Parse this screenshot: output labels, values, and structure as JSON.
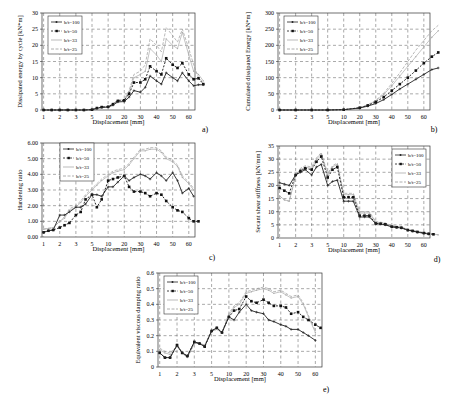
{
  "figure": {
    "panels": [
      "a)",
      "b)",
      "c)",
      "d)",
      "e)"
    ]
  },
  "legend": [
    "b/t=100",
    "b/t=50",
    "b/t=33",
    "b/t=25"
  ],
  "series_styles": [
    {
      "name": "b/t=100",
      "color": "#222222",
      "marker": "plus",
      "dash": ""
    },
    {
      "name": "b/t=50",
      "color": "#111111",
      "marker": "square",
      "dash": "2,1.5"
    },
    {
      "name": "b/t=33",
      "color": "#aaaaaa",
      "marker": "dot",
      "dash": ""
    },
    {
      "name": "b/t=25",
      "color": "#999999",
      "marker": "tick",
      "dash": "3,1.5"
    }
  ],
  "chart_data": [
    {
      "id": "a",
      "type": "line",
      "title": "",
      "panel_label": "a)",
      "xlabel": "Displacement [mm]",
      "ylabel": "Dissipated energy by cycle [kN*m]",
      "xticks": [
        "1",
        "2",
        "3",
        "5",
        "10",
        "20",
        "30",
        "40",
        "50",
        "60"
      ],
      "yticks": [
        "0",
        "5",
        "10",
        "15",
        "20",
        "25",
        "30"
      ],
      "ylim": [
        0,
        30
      ],
      "grid": true,
      "legend_position": "top-left",
      "x_index": [
        0,
        0.5,
        1,
        1.5,
        2,
        2.5,
        3,
        3.3,
        3.6,
        4,
        4.3,
        4.6,
        5,
        5.3,
        5.6,
        6,
        6.3,
        6.6,
        7,
        7.3,
        7.6,
        8,
        8.3,
        8.6,
        9,
        9.3,
        9.6,
        9.9
      ],
      "series": [
        {
          "name": "b/t=100",
          "values": [
            0,
            0,
            0,
            0,
            0,
            0,
            0.1,
            0.5,
            0.8,
            0.9,
            1.5,
            2.5,
            2.6,
            4,
            6,
            5.5,
            7,
            10.5,
            9,
            8,
            11.5,
            10,
            9,
            11.5,
            9,
            7.5,
            7.8,
            7.8
          ]
        },
        {
          "name": "b/t=50",
          "values": [
            0,
            0,
            0,
            0,
            0,
            0,
            0.1,
            0.6,
            0.9,
            1,
            1.8,
            2.8,
            3,
            5,
            8.5,
            8.5,
            9.5,
            13.5,
            12,
            11,
            16,
            14,
            13,
            14.5,
            11,
            9.5,
            9.8,
            8
          ]
        },
        {
          "name": "b/t=33",
          "values": [
            0,
            0,
            0,
            0,
            0,
            0,
            0.1,
            0.6,
            0.9,
            1,
            2,
            3,
            3.2,
            5.5,
            10,
            11,
            12,
            19,
            17,
            15,
            22,
            20,
            19,
            24,
            17,
            12,
            11,
            9
          ]
        },
        {
          "name": "b/t=25",
          "values": [
            0,
            0,
            0,
            0,
            0,
            0,
            0.1,
            0.6,
            0.9,
            1,
            2,
            3,
            3.3,
            6,
            11,
            12,
            14,
            22,
            20,
            18,
            25.5,
            23,
            21,
            25,
            19,
            14,
            10,
            8.5
          ]
        }
      ]
    },
    {
      "id": "b",
      "type": "line",
      "title": "",
      "panel_label": "b)",
      "xlabel": "Displacement [mm]",
      "ylabel": "Cumulated dissipated Energy [kN*m]",
      "xticks": [
        "1",
        "2",
        "3",
        "5",
        "10",
        "20",
        "30",
        "40",
        "50",
        "60"
      ],
      "yticks": [
        "0",
        "50",
        "100",
        "150",
        "200",
        "250",
        "300"
      ],
      "ylim": [
        0,
        300
      ],
      "grid": true,
      "legend_position": "top-left",
      "x_index": [
        0,
        1,
        2,
        3,
        4,
        5,
        5.5,
        6,
        6.5,
        7,
        7.5,
        8,
        8.5,
        9,
        9.5,
        9.9
      ],
      "series": [
        {
          "name": "b/t=100",
          "values": [
            0,
            0,
            0,
            0,
            1,
            6,
            12,
            20,
            32,
            48,
            65,
            80,
            95,
            110,
            125,
            130
          ]
        },
        {
          "name": "b/t=50",
          "values": [
            0,
            0,
            0,
            0,
            1,
            7,
            14,
            25,
            40,
            60,
            80,
            100,
            122,
            145,
            165,
            178
          ]
        },
        {
          "name": "b/t=33",
          "values": [
            0,
            0,
            0,
            0,
            1,
            7,
            15,
            28,
            48,
            75,
            105,
            135,
            165,
            195,
            225,
            245
          ]
        },
        {
          "name": "b/t=25",
          "values": [
            0,
            0,
            0,
            0,
            1,
            7,
            16,
            30,
            52,
            82,
            115,
            150,
            185,
            215,
            245,
            262
          ]
        }
      ]
    },
    {
      "id": "c",
      "type": "line",
      "title": "",
      "panel_label": "c)",
      "xlabel": "Displacement [mm]",
      "ylabel": "Hardening ratio",
      "xticks": [
        "1",
        "2",
        "3",
        "5",
        "10",
        "20",
        "30",
        "40",
        "50",
        "60"
      ],
      "yticks": [
        "0.00",
        "1.00",
        "2.00",
        "3.00",
        "4.00",
        "5.00",
        "6.00"
      ],
      "ylim": [
        0,
        6
      ],
      "grid": true,
      "legend_position": "top-left",
      "x_index": [
        0,
        0.3,
        0.6,
        1,
        1.3,
        1.6,
        2,
        2.3,
        2.6,
        3,
        3.3,
        3.6,
        4,
        4.3,
        4.6,
        5,
        5.3,
        5.6,
        6,
        6.3,
        6.6,
        7,
        7.3,
        7.6,
        8,
        8.3,
        8.6,
        9,
        9.3,
        9.6,
        9.9
      ],
      "series": [
        {
          "name": "b/t=100",
          "values": [
            0.3,
            0.4,
            0.45,
            1.4,
            1.4,
            1.6,
            1.9,
            1.9,
            2.1,
            2.7,
            2.7,
            2.6,
            3.2,
            3.2,
            3.5,
            3.9,
            3.6,
            3.8,
            4.0,
            3.9,
            3.7,
            4.1,
            3.9,
            3.6,
            4.1,
            3.6,
            2.8,
            3.1,
            2.6,
            null,
            null
          ]
        },
        {
          "name": "b/t=50",
          "values": [
            0.3,
            0.4,
            0.45,
            0.6,
            0.75,
            0.9,
            1.4,
            1.6,
            2.4,
            2.7,
            1.9,
            2.4,
            3.6,
            3.7,
            3.8,
            3.9,
            3.2,
            2.9,
            2.9,
            2.8,
            2.6,
            2.8,
            2.7,
            2.3,
            1.9,
            1.7,
            1.6,
            1.2,
            1.0,
            1.0,
            null
          ]
        },
        {
          "name": "b/t=33",
          "values": [
            0.5,
            0.55,
            0.6,
            1.0,
            1.2,
            1.7,
            1.9,
            2.2,
            2.6,
            3.0,
            3.3,
            3.6,
            3.9,
            4.1,
            4.2,
            4.3,
            4.6,
            5.0,
            5.5,
            5.5,
            5.6,
            5.6,
            5.4,
            5.0,
            4.8,
            4.5,
            3.8,
            3.4,
            3.0,
            null,
            null
          ]
        },
        {
          "name": "b/t=25",
          "values": [
            0.5,
            0.55,
            0.6,
            1.0,
            1.3,
            1.8,
            2.0,
            2.3,
            2.7,
            3.1,
            3.4,
            3.7,
            4.0,
            4.2,
            4.3,
            4.4,
            4.7,
            5.1,
            5.6,
            5.6,
            5.7,
            5.7,
            5.5,
            5.1,
            4.9,
            4.6,
            3.9,
            3.5,
            3.1,
            null,
            null
          ]
        }
      ]
    },
    {
      "id": "d",
      "type": "line",
      "title": "",
      "panel_label": "d)",
      "xlabel": "Displacement [mm]",
      "ylabel": "Secant shear stiffness [kN/mm]",
      "xticks": [
        "1",
        "2",
        "3",
        "5",
        "10",
        "20",
        "30",
        "40",
        "50",
        "60"
      ],
      "yticks": [
        "0",
        "5",
        "10",
        "15",
        "20",
        "25",
        "30",
        "35"
      ],
      "ylim": [
        0,
        35
      ],
      "grid": true,
      "legend_position": "top-right",
      "x_index": [
        0,
        0.3,
        0.6,
        1,
        1.3,
        1.6,
        2,
        2.3,
        2.6,
        3,
        3.3,
        3.6,
        4,
        4.3,
        4.6,
        5,
        5.3,
        5.6,
        6,
        6.3,
        6.6,
        7,
        7.3,
        7.6,
        8,
        8.3,
        8.6,
        9,
        9.3,
        9.6,
        9.9
      ],
      "series": [
        {
          "name": "b/t=100",
          "values": [
            21,
            20.5,
            20,
            24,
            25,
            26,
            24,
            27,
            28,
            20,
            21.5,
            22,
            14,
            14,
            14,
            8,
            8,
            8,
            5.5,
            5.3,
            5,
            4.2,
            4,
            3.8,
            3,
            2.6,
            2.2,
            1.8,
            1.5,
            null,
            null
          ]
        },
        {
          "name": "b/t=50",
          "values": [
            19,
            18,
            17,
            24,
            25.5,
            26.5,
            26,
            29,
            31,
            23,
            26,
            27,
            15.5,
            15.5,
            15.5,
            8.5,
            8.5,
            8.5,
            5.5,
            5.4,
            5.2,
            4.3,
            4.1,
            3.9,
            3,
            2.7,
            2.3,
            1.9,
            1.6,
            1.4,
            null
          ]
        },
        {
          "name": "b/t=33",
          "values": [
            16,
            14.5,
            14,
            23.5,
            26,
            27,
            26.5,
            30,
            32,
            24,
            27,
            28,
            16.5,
            16.5,
            16.5,
            9.5,
            9.5,
            9.5,
            6,
            5.8,
            5.5,
            4.6,
            4.3,
            4.1,
            3.2,
            2.8,
            2.4,
            2,
            1.7,
            1.5,
            1.2
          ]
        },
        {
          "name": "b/t=25",
          "values": [
            16,
            14.5,
            14,
            23.5,
            26.5,
            27.5,
            27,
            30.5,
            32.5,
            24.5,
            27.5,
            28.5,
            17,
            17,
            17,
            10,
            10,
            10,
            6.2,
            6,
            5.7,
            4.7,
            4.4,
            4.2,
            3.3,
            2.9,
            2.5,
            2.1,
            1.8,
            1.5,
            1.2
          ]
        }
      ]
    },
    {
      "id": "e",
      "type": "line",
      "title": "",
      "panel_label": "e)",
      "xlabel": "Displacement [mm]",
      "ylabel": "Equivalent viscous damping ratio",
      "xticks": [
        "1",
        "2",
        "3",
        "5",
        "10",
        "20",
        "30",
        "40",
        "50",
        "60"
      ],
      "yticks": [
        "0",
        "0.1",
        "0.2",
        "0.3",
        "0.4",
        "0.5",
        "0.6"
      ],
      "ylim": [
        0,
        0.6
      ],
      "grid": true,
      "legend_position": "top-left",
      "x_index": [
        0,
        0.3,
        0.6,
        1,
        1.3,
        1.6,
        2,
        2.3,
        2.6,
        3,
        3.3,
        3.6,
        4,
        4.3,
        4.6,
        5,
        5.3,
        5.6,
        6,
        6.3,
        6.6,
        7,
        7.3,
        7.6,
        8,
        8.3,
        8.6,
        9,
        9.3,
        9.6,
        9.9
      ],
      "series": [
        {
          "name": "b/t=100",
          "values": [
            0.09,
            0.06,
            0.06,
            0.14,
            0.09,
            0.07,
            0.16,
            0.15,
            0.13,
            0.23,
            0.25,
            0.22,
            0.32,
            0.3,
            0.35,
            0.4,
            0.36,
            0.35,
            0.34,
            0.3,
            0.29,
            0.27,
            0.26,
            0.24,
            0.24,
            0.22,
            0.2,
            0.17,
            null,
            null,
            null
          ]
        },
        {
          "name": "b/t=50",
          "values": [
            0.09,
            0.06,
            0.06,
            0.14,
            0.09,
            0.07,
            0.16,
            0.15,
            0.13,
            0.23,
            0.25,
            0.22,
            0.32,
            0.36,
            0.37,
            0.45,
            0.42,
            0.41,
            0.43,
            0.41,
            0.39,
            0.39,
            0.38,
            0.34,
            0.35,
            0.32,
            0.3,
            0.27,
            0.25,
            null,
            null
          ]
        },
        {
          "name": "b/t=33",
          "values": [
            0.11,
            0.09,
            0.08,
            0.13,
            0.09,
            0.06,
            0.15,
            0.15,
            0.14,
            0.23,
            0.24,
            0.22,
            0.33,
            0.38,
            0.4,
            0.47,
            0.48,
            0.49,
            0.5,
            0.49,
            0.47,
            0.48,
            0.46,
            0.44,
            0.45,
            0.4,
            0.32,
            0.22,
            null,
            null,
            null
          ]
        },
        {
          "name": "b/t=25",
          "values": [
            0.12,
            0.1,
            0.09,
            0.13,
            0.09,
            0.06,
            0.15,
            0.15,
            0.14,
            0.23,
            0.24,
            0.22,
            0.34,
            0.39,
            0.41,
            0.48,
            0.49,
            0.5,
            0.51,
            0.5,
            0.48,
            0.49,
            0.47,
            0.45,
            0.46,
            0.41,
            0.33,
            0.23,
            null,
            null,
            null
          ]
        }
      ]
    }
  ]
}
